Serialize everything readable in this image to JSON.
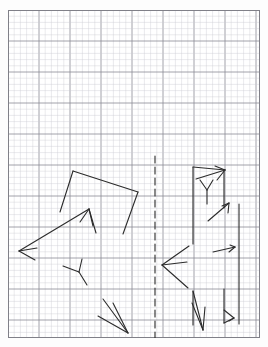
{
  "page": {
    "kind": "graph-paper-drawing",
    "background_color": "#ffffff",
    "width": 268,
    "height": 347
  },
  "grid": {
    "origin_x": 8,
    "origin_y": 10,
    "width": 252,
    "height": 328,
    "minor_cell_px": 6.2,
    "major_every": 5,
    "minor_color": "#c9c9d2",
    "major_color": "#8a8a96",
    "border_color": "#808088",
    "minor_width": 0.4,
    "major_width": 0.8
  },
  "drawing": {
    "ink_color": "#2b2b2b",
    "stroke_width": 1.1,
    "mirror_axis": {
      "name": "dashed-mirror-line",
      "x": 155,
      "y1": 156,
      "y2": 338,
      "dash": "7 4",
      "color": "#2b2b2b",
      "width": 1.1
    },
    "left_figure": {
      "name": "left-polygon-with-arrows",
      "polyline": [
        [
          73,
          171
        ],
        [
          138,
          192
        ],
        [
          123,
          234
        ],
        [
          60,
          212
        ]
      ],
      "closed": false,
      "strokes": [
        {
          "name": "poly-edge-top",
          "points": [
            [
              73,
              171
            ],
            [
              138,
              192
            ]
          ]
        },
        {
          "name": "poly-edge-right",
          "points": [
            [
              138,
              192
            ],
            [
              123,
              234
            ]
          ]
        },
        {
          "name": "poly-edge-left",
          "points": [
            [
              73,
              171
            ],
            [
              60,
              212
            ]
          ]
        }
      ],
      "arrows": [
        {
          "name": "left-arrow-long",
          "tail": [
            89,
            209
          ],
          "tip": [
            19,
            251
          ],
          "head_left": [
            37,
            248
          ],
          "head_right": [
            35,
            260
          ]
        },
        {
          "name": "up-arrow-short",
          "tail": [
            96,
            233
          ],
          "tip": [
            89,
            209
          ],
          "head_left": [
            80,
            222
          ],
          "head_right": [
            93,
            226
          ]
        },
        {
          "name": "down-right-arrow-bundle",
          "tip": [
            128,
            333
          ],
          "head_left": [
            103,
            299
          ],
          "head_right": [
            98,
            316
          ],
          "shaft": [
            [
              113,
              303
            ],
            [
              128,
              333
            ]
          ]
        }
      ],
      "y_marks": [
        {
          "name": "left-y-mark",
          "center": [
            79,
            272
          ],
          "arm_a": [
            63,
            266
          ],
          "arm_b": [
            82,
            259
          ],
          "arm_c": [
            87,
            285
          ]
        }
      ]
    },
    "right_figure": {
      "name": "right-polygon-with-arrows",
      "strokes": [
        {
          "name": "right-edge-upper-left",
          "points": [
            [
              193,
              167
            ],
            [
              193,
              244
            ]
          ]
        },
        {
          "name": "right-edge-top",
          "points": [
            [
              193,
              167
            ],
            [
              225,
              170
            ]
          ]
        },
        {
          "name": "right-edge-inner-right-upper",
          "points": [
            [
              224,
              171
            ],
            [
              224,
              208
            ]
          ]
        },
        {
          "name": "right-edge-outer-right",
          "points": [
            [
              239,
              204
            ],
            [
              239,
              324
            ]
          ]
        },
        {
          "name": "right-edge-bottom-left",
          "points": [
            [
              193,
              291
            ],
            [
              193,
              325
            ]
          ]
        },
        {
          "name": "right-edge-bottom-inner",
          "points": [
            [
              224,
              289
            ],
            [
              224,
              323
            ]
          ]
        }
      ],
      "arrows": [
        {
          "name": "up-right-arrow",
          "tail": [
            196,
            179
          ],
          "tip": [
            225,
            170
          ],
          "head_left": [
            215,
            166
          ],
          "head_right": [
            217,
            180
          ]
        },
        {
          "name": "left-arrow-right-figure",
          "tip": [
            162,
            265
          ],
          "head_left": [
            189,
            246
          ],
          "head_right": [
            188,
            288
          ],
          "shaft": [
            [
              187,
              262
            ],
            [
              162,
              265
            ]
          ]
        },
        {
          "name": "diag-arrow-mid-right",
          "tail": [
            208,
            221
          ],
          "tip": [
            229,
            203
          ],
          "head_left": [
            222,
            206
          ],
          "head_right": [
            228,
            213
          ]
        },
        {
          "name": "short-arrow-right-mid",
          "tail": [
            213,
            252
          ],
          "tip": [
            235,
            247
          ],
          "head_left": [
            230,
            245
          ],
          "head_right": [
            229,
            252
          ]
        },
        {
          "name": "down-left-arrow-bottom",
          "tail": [
            193,
            291
          ],
          "tip": [
            203,
            330
          ],
          "head_left": [
            192,
            303
          ],
          "head_right": [
            205,
            307
          ]
        },
        {
          "name": "bottom-right-arrow",
          "tail": [
            224,
            323
          ],
          "tip": [
            234,
            318
          ],
          "head_left": [
            224,
            310
          ],
          "head_right": [
            229,
            321
          ]
        }
      ],
      "y_marks": [
        {
          "name": "right-y-mark",
          "center": [
            207,
            190
          ],
          "arm_a": [
            200,
            180
          ],
          "arm_b": [
            213,
            180
          ],
          "arm_c": [
            207,
            204
          ]
        }
      ]
    }
  }
}
